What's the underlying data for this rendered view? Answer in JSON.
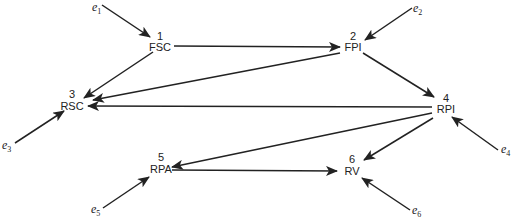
{
  "diagram": {
    "type": "path-diagram",
    "nodes": [
      {
        "id": "1",
        "number": "1",
        "label": "FSC",
        "x": 193,
        "y": 46
      },
      {
        "id": "2",
        "number": "2",
        "label": "FPI",
        "x": 352,
        "y": 46
      },
      {
        "id": "3",
        "number": "3",
        "label": "RSC",
        "x": 72,
        "y": 104
      },
      {
        "id": "4",
        "number": "4",
        "label": "RPI",
        "x": 446,
        "y": 104
      },
      {
        "id": "5",
        "number": "5",
        "label": "RPA",
        "x": 161,
        "y": 169
      },
      {
        "id": "6",
        "number": "6",
        "label": "RV",
        "x": 352,
        "y": 175
      }
    ],
    "errors": [
      {
        "id": "e1",
        "base": "e",
        "sub": "1",
        "x": 92,
        "y": 8,
        "target": "1"
      },
      {
        "id": "e2",
        "base": "e",
        "sub": "2",
        "x": 415,
        "y": 12,
        "target": "2"
      },
      {
        "id": "e3",
        "base": "e",
        "sub": "3",
        "x": 2,
        "y": 147,
        "target": "3"
      },
      {
        "id": "e4",
        "base": "e",
        "sub": "4",
        "x": 503,
        "y": 150,
        "target": "4"
      },
      {
        "id": "e5",
        "base": "e",
        "sub": "5",
        "x": 91,
        "y": 212,
        "target": "5"
      },
      {
        "id": "e6",
        "base": "e",
        "sub": "6",
        "x": 412,
        "y": 213,
        "target": "6"
      }
    ],
    "edges": [
      {
        "from": "1",
        "to": "2"
      },
      {
        "from": "1",
        "to": "3"
      },
      {
        "from": "2",
        "to": "3"
      },
      {
        "from": "2",
        "to": "4"
      },
      {
        "from": "4",
        "to": "3"
      },
      {
        "from": "4",
        "to": "5"
      },
      {
        "from": "4",
        "to": "6"
      },
      {
        "from": "5",
        "to": "6"
      }
    ]
  }
}
